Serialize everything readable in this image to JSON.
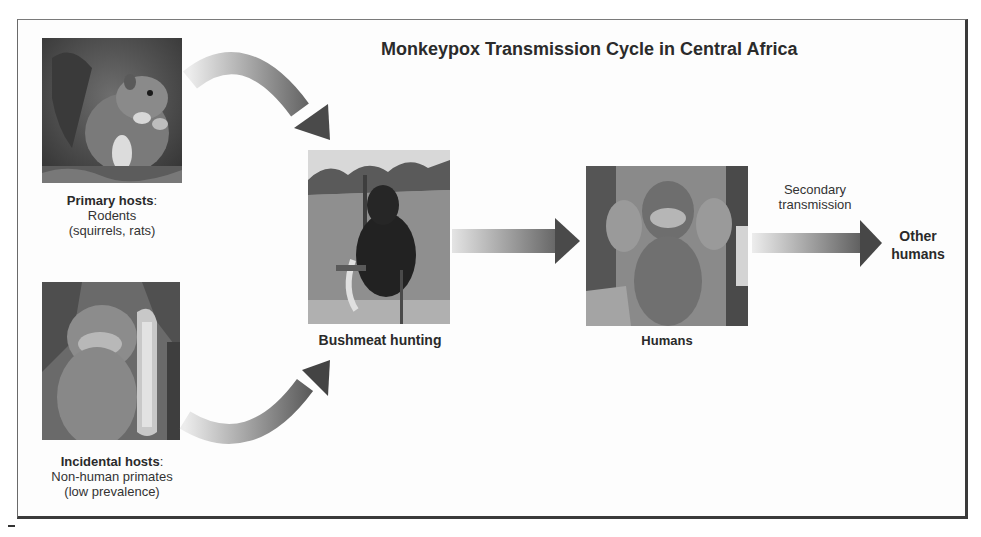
{
  "title": "Monkeypox Transmission Cycle in Central Africa",
  "nodes": {
    "primary_hosts": {
      "heading": "Primary hosts",
      "colon": ":",
      "line2": "Rodents",
      "line3": "(squirrels, rats)",
      "image": "squirrel-photo"
    },
    "incidental_hosts": {
      "heading": "Incidental hosts",
      "colon": ":",
      "line2": "Non-human primates",
      "line3": "(low prevalence)",
      "image": "monkey-photo"
    },
    "bushmeat": {
      "label": "Bushmeat hunting",
      "image": "hunted-animal-photo"
    },
    "humans": {
      "label": "Humans",
      "image": "child-with-lesions-photo"
    },
    "other_humans": {
      "line1": "Other",
      "line2": "humans"
    }
  },
  "edges": {
    "secondary": {
      "line1": "Secondary",
      "line2": "transmission"
    }
  },
  "colors": {
    "arrow_dark": "#4a4a4a",
    "arrow_light": "#e6e6e6",
    "border": "#3a3a3a",
    "text": "#2a2a2a"
  }
}
